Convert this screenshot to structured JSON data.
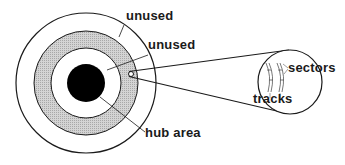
{
  "diagram": {
    "labels": {
      "outer_unused": "unused",
      "inner_unused": "unused",
      "hub": "hub area",
      "sectors": "sectors",
      "tracks": "tracks"
    },
    "colors": {
      "stroke": "#1a1a1a",
      "data_band": "#c8c8c8",
      "hub": "#000000",
      "background": "#ffffff"
    }
  }
}
